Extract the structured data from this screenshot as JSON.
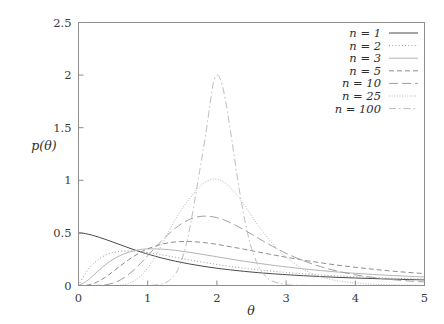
{
  "chart_data": {
    "type": "line",
    "title": "",
    "xlabel": "θ",
    "ylabel": "p(θ)",
    "xlim": [
      0,
      5
    ],
    "ylim": [
      0,
      2.5
    ],
    "xticks": [
      "0",
      "1",
      "2",
      "3",
      "4",
      "5"
    ],
    "xtick_values": [
      0,
      1,
      2,
      3,
      4,
      5
    ],
    "yticks": [
      "0",
      "0.5",
      "1",
      "1.5",
      "2",
      "2.5"
    ],
    "ytick_values": [
      0,
      0.5,
      1,
      1.5,
      2,
      2.5
    ],
    "grid": false,
    "legend_position": "top-right",
    "legend_entries": [
      {
        "label": "n = 1",
        "n": 1,
        "dash": "none",
        "stroke": "#4a4a4a",
        "width": 1.0
      },
      {
        "label": "n = 2",
        "n": 2,
        "dash": "1,2.2",
        "stroke": "#9a9a9a",
        "width": 1.0
      },
      {
        "label": "n = 3",
        "n": 3,
        "dash": "none",
        "stroke": "#b4b4b4",
        "width": 1.0
      },
      {
        "label": "n = 5",
        "n": 5,
        "dash": "5,3",
        "stroke": "#8e8e8e",
        "width": 1.0
      },
      {
        "label": "n = 10",
        "n": 10,
        "dash": "9,4",
        "stroke": "#a0a0a0",
        "width": 1.0
      },
      {
        "label": "n = 25",
        "n": 25,
        "dash": "1,1.6",
        "stroke": "#b8b8b8",
        "width": 1.0
      },
      {
        "label": "n = 100",
        "n": 100,
        "dash": "7,3,1.5,3",
        "stroke": "#bdbdbd",
        "width": 1.0
      }
    ],
    "series": [
      {
        "name": "n = 1",
        "peak_theta": 0.0,
        "peak_value": 0.5,
        "x": [
          0.0,
          0.1,
          0.2,
          0.3,
          0.4,
          0.5,
          0.6,
          0.7,
          0.8,
          0.9,
          1.0,
          1.2,
          1.4,
          1.6,
          1.8,
          2.0,
          2.2,
          2.4,
          2.6,
          2.8,
          3.0,
          3.25,
          3.5,
          3.75,
          4.0,
          4.25,
          4.5,
          4.75,
          5.0
        ],
        "values": [
          0.5,
          0.493,
          0.478,
          0.458,
          0.436,
          0.412,
          0.388,
          0.364,
          0.341,
          0.319,
          0.299,
          0.262,
          0.231,
          0.205,
          0.183,
          0.164,
          0.148,
          0.134,
          0.122,
          0.112,
          0.103,
          0.093,
          0.085,
          0.077,
          0.071,
          0.066,
          0.061,
          0.057,
          0.053
        ]
      },
      {
        "name": "n = 2",
        "peak_theta": 0.72,
        "peak_value": 0.329,
        "x": [
          0.0,
          0.1,
          0.2,
          0.3,
          0.4,
          0.5,
          0.6,
          0.7,
          0.8,
          0.9,
          1.0,
          1.2,
          1.4,
          1.6,
          1.8,
          2.0,
          2.2,
          2.4,
          2.6,
          2.8,
          3.0,
          3.25,
          3.5,
          3.75,
          4.0,
          4.25,
          4.5,
          4.75,
          5.0
        ],
        "values": [
          0.0,
          0.116,
          0.197,
          0.253,
          0.291,
          0.313,
          0.325,
          0.329,
          0.328,
          0.322,
          0.314,
          0.292,
          0.268,
          0.244,
          0.221,
          0.2,
          0.181,
          0.164,
          0.149,
          0.136,
          0.124,
          0.111,
          0.1,
          0.091,
          0.083,
          0.076,
          0.07,
          0.065,
          0.06
        ]
      },
      {
        "name": "n = 3",
        "peak_theta": 1.05,
        "peak_value": 0.348,
        "x": [
          0.0,
          0.1,
          0.2,
          0.3,
          0.4,
          0.5,
          0.6,
          0.7,
          0.8,
          0.9,
          1.0,
          1.2,
          1.4,
          1.6,
          1.8,
          2.0,
          2.2,
          2.4,
          2.6,
          2.8,
          3.0,
          3.25,
          3.5,
          3.75,
          4.0,
          4.25,
          4.5,
          4.75,
          5.0
        ],
        "values": [
          0.0,
          0.032,
          0.088,
          0.148,
          0.203,
          0.248,
          0.284,
          0.311,
          0.33,
          0.342,
          0.348,
          0.346,
          0.334,
          0.316,
          0.295,
          0.273,
          0.251,
          0.23,
          0.211,
          0.193,
          0.177,
          0.158,
          0.142,
          0.128,
          0.116,
          0.105,
          0.096,
          0.088,
          0.081
        ]
      },
      {
        "name": "n = 5",
        "peak_theta": 1.42,
        "peak_value": 0.416,
        "x": [
          0.0,
          0.1,
          0.2,
          0.3,
          0.4,
          0.5,
          0.6,
          0.7,
          0.8,
          0.9,
          1.0,
          1.2,
          1.4,
          1.6,
          1.8,
          2.0,
          2.2,
          2.4,
          2.6,
          2.8,
          3.0,
          3.25,
          3.5,
          3.75,
          4.0,
          4.25,
          4.5,
          4.75,
          5.0
        ],
        "values": [
          0.0,
          0.002,
          0.015,
          0.043,
          0.084,
          0.133,
          0.184,
          0.233,
          0.278,
          0.317,
          0.349,
          0.392,
          0.414,
          0.418,
          0.409,
          0.391,
          0.368,
          0.344,
          0.318,
          0.293,
          0.269,
          0.241,
          0.216,
          0.193,
          0.173,
          0.155,
          0.139,
          0.125,
          0.113
        ]
      },
      {
        "name": "n = 10",
        "peak_theta": 1.72,
        "peak_value": 0.66,
        "x": [
          0.0,
          0.1,
          0.2,
          0.3,
          0.4,
          0.5,
          0.6,
          0.7,
          0.8,
          0.9,
          1.0,
          1.2,
          1.4,
          1.6,
          1.8,
          2.0,
          2.2,
          2.4,
          2.6,
          2.8,
          3.0,
          3.25,
          3.5,
          3.75,
          4.0,
          4.25,
          4.5,
          4.75,
          5.0
        ],
        "values": [
          0.0,
          0.0,
          0.0,
          0.002,
          0.008,
          0.023,
          0.051,
          0.093,
          0.148,
          0.213,
          0.283,
          0.424,
          0.545,
          0.627,
          0.659,
          0.645,
          0.596,
          0.526,
          0.449,
          0.374,
          0.306,
          0.235,
          0.179,
          0.135,
          0.102,
          0.077,
          0.058,
          0.044,
          0.034
        ]
      },
      {
        "name": "n = 25",
        "peak_theta": 1.88,
        "peak_value": 1.01,
        "x": [
          0.0,
          0.1,
          0.2,
          0.3,
          0.4,
          0.5,
          0.6,
          0.7,
          0.8,
          0.9,
          1.0,
          1.1,
          1.2,
          1.3,
          1.4,
          1.5,
          1.6,
          1.7,
          1.8,
          1.9,
          2.0,
          2.1,
          2.2,
          2.3,
          2.4,
          2.5,
          2.6,
          2.8,
          3.0,
          3.25,
          3.5,
          3.75,
          4.0,
          4.25,
          4.5,
          4.75,
          5.0
        ],
        "values": [
          0.0,
          0.0,
          0.0,
          0.0,
          0.0,
          0.001,
          0.004,
          0.015,
          0.042,
          0.091,
          0.166,
          0.266,
          0.384,
          0.508,
          0.628,
          0.734,
          0.82,
          0.903,
          0.968,
          1.005,
          1.01,
          0.983,
          0.927,
          0.85,
          0.76,
          0.664,
          0.568,
          0.4,
          0.27,
          0.153,
          0.083,
          0.044,
          0.024,
          0.013,
          0.007,
          0.004,
          0.002
        ]
      },
      {
        "name": "n = 100",
        "peak_theta": 1.96,
        "peak_value": 2.0,
        "x": [
          0.0,
          0.2,
          0.4,
          0.6,
          0.8,
          1.0,
          1.1,
          1.2,
          1.3,
          1.4,
          1.45,
          1.5,
          1.55,
          1.6,
          1.65,
          1.7,
          1.75,
          1.8,
          1.85,
          1.9,
          1.95,
          2.0,
          2.05,
          2.1,
          2.15,
          2.2,
          2.25,
          2.3,
          2.35,
          2.4,
          2.45,
          2.5,
          2.6,
          2.7,
          2.8,
          3.0,
          3.25,
          3.5,
          3.75,
          4.0,
          4.5,
          5.0
        ],
        "values": [
          0.0,
          0.0,
          0.0,
          0.0,
          0.0,
          0.001,
          0.004,
          0.014,
          0.042,
          0.11,
          0.172,
          0.259,
          0.375,
          0.521,
          0.695,
          0.888,
          1.086,
          1.277,
          1.49,
          1.72,
          1.93,
          2.0,
          1.96,
          1.84,
          1.66,
          1.45,
          1.23,
          1.01,
          0.81,
          0.63,
          0.48,
          0.355,
          0.185,
          0.09,
          0.042,
          0.008,
          0.001,
          0.0,
          0.0,
          0.0,
          0.0,
          0.0
        ]
      }
    ]
  },
  "axes": {
    "x_title": "θ",
    "y_title": "p(θ)"
  }
}
